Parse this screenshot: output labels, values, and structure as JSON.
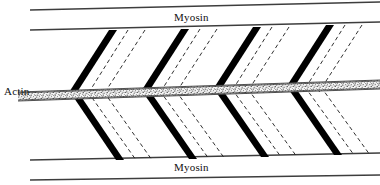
{
  "figure": {
    "background_color": "#ffffff",
    "width": 380,
    "height": 185
  },
  "labels": {
    "myosin_top": "Myosin",
    "myosin_bottom": "Myosin",
    "actin": "Actin"
  },
  "colors": {
    "line": "#3d3d3d",
    "crossbridge": "#000000",
    "dashed": "#1a1a1a",
    "actin_band_fill": "#f2f2f2",
    "actin_band_stipple": "#2b2b2b",
    "text": "#111111"
  },
  "diagram_data": {
    "type": "diagram",
    "subject": "skeletal muscle sarcomere cross-bridge arrangement",
    "myosin_lines": [
      {
        "name": "myosin-top-outer",
        "x1": 30,
        "y1": 10,
        "x2": 380,
        "y2": 2
      },
      {
        "name": "myosin-top-inner",
        "x1": 30,
        "y1": 30,
        "x2": 380,
        "y2": 22
      },
      {
        "name": "myosin-bottom-inner",
        "x1": 30,
        "y1": 160,
        "x2": 380,
        "y2": 153
      },
      {
        "name": "myosin-bottom-outer",
        "x1": 30,
        "y1": 180,
        "x2": 380,
        "y2": 175
      }
    ],
    "actin_band": {
      "x1": 18,
      "y1": 96,
      "x2": 380,
      "y2": 84,
      "thickness": 9,
      "texture": "stippled"
    },
    "crossbridge_units": [
      {
        "index": 1,
        "top_x": 113,
        "mid_x": 70,
        "bottom_x": 120,
        "dashed_offsets": [
          18,
          34
        ]
      },
      {
        "index": 2,
        "top_x": 185,
        "mid_x": 142,
        "bottom_x": 193,
        "dashed_offsets": [
          18,
          34
        ]
      },
      {
        "index": 3,
        "top_x": 257,
        "mid_x": 214,
        "bottom_x": 265,
        "dashed_offsets": [
          18,
          34
        ]
      },
      {
        "index": 4,
        "top_x": 330,
        "mid_x": 287,
        "bottom_x": 338,
        "dashed_offsets": [
          18,
          34
        ]
      }
    ],
    "crossbridge_thickness": 7,
    "dashed_pattern": "4 3",
    "notes": "Each unit is a V shape: a thick black bar descends from the upper myosin line to the actin band, then descends again to the lower myosin line; two thin dashed parallel lines trail each bar."
  }
}
